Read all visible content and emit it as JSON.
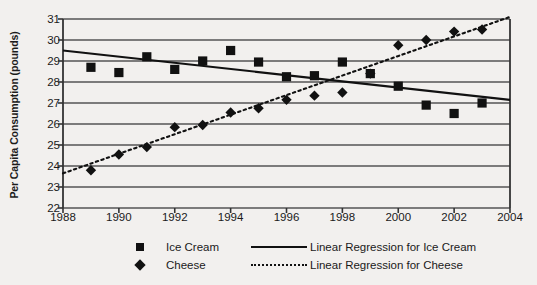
{
  "chart_data": {
    "type": "scatter",
    "title": "",
    "xlabel": "",
    "ylabel": "Per Capita Consumption (pounds)",
    "xlim": [
      1988,
      2004
    ],
    "ylim": [
      22,
      31
    ],
    "xticks": [
      1988,
      1990,
      1992,
      1994,
      1996,
      1998,
      2000,
      2002,
      2004
    ],
    "yticks": [
      22,
      23,
      24,
      25,
      26,
      27,
      28,
      29,
      30,
      31
    ],
    "grid": "horizontal",
    "legend_position": "bottom",
    "series": [
      {
        "name": "Ice Cream",
        "marker": "square",
        "color": "#111111",
        "x": [
          1989,
          1990,
          1991,
          1992,
          1993,
          1994,
          1995,
          1996,
          1997,
          1998,
          1999,
          2000,
          2001,
          2002,
          2003
        ],
        "values": [
          28.7,
          28.45,
          29.2,
          28.6,
          29.0,
          29.5,
          28.95,
          28.25,
          28.3,
          28.95,
          28.4,
          27.8,
          26.9,
          26.5,
          27.0
        ]
      },
      {
        "name": "Cheese",
        "marker": "diamond",
        "color": "#111111",
        "x": [
          1989,
          1990,
          1991,
          1992,
          1993,
          1994,
          1995,
          1996,
          1997,
          1998,
          1999,
          2000,
          2001,
          2002,
          2003
        ],
        "values": [
          23.8,
          24.55,
          24.9,
          25.85,
          25.95,
          26.55,
          26.75,
          27.15,
          27.35,
          27.5,
          28.4,
          29.75,
          30.0,
          30.4,
          30.5
        ]
      }
    ],
    "trendlines": [
      {
        "name": "Linear Regression for Ice Cream",
        "style": "solid",
        "color": "#111111",
        "x": [
          1988,
          2004
        ],
        "y": [
          29.5,
          27.15
        ]
      },
      {
        "name": "Linear Regression for Cheese",
        "style": "dotted",
        "color": "#111111",
        "x": [
          1988,
          2004
        ],
        "y": [
          23.65,
          31.1
        ]
      }
    ]
  },
  "axis": {
    "ylabel": "Per Capita Consumption (pounds)",
    "ytick_labels": [
      "31",
      "30",
      "29",
      "28",
      "27",
      "26",
      "25",
      "24",
      "23",
      "22"
    ],
    "xtick_labels": [
      "1988",
      "1990",
      "1992",
      "1994",
      "1996",
      "1998",
      "2000",
      "2002",
      "2004"
    ]
  },
  "legend": {
    "entries": [
      {
        "marker_name": "square-marker",
        "label": "Ice Cream",
        "line_name": "solid-line",
        "line_label": "Linear Regression for Ice Cream"
      },
      {
        "marker_name": "diamond-marker",
        "label": "Cheese",
        "line_name": "dotted-line",
        "line_label": "Linear Regression for Cheese"
      }
    ]
  }
}
